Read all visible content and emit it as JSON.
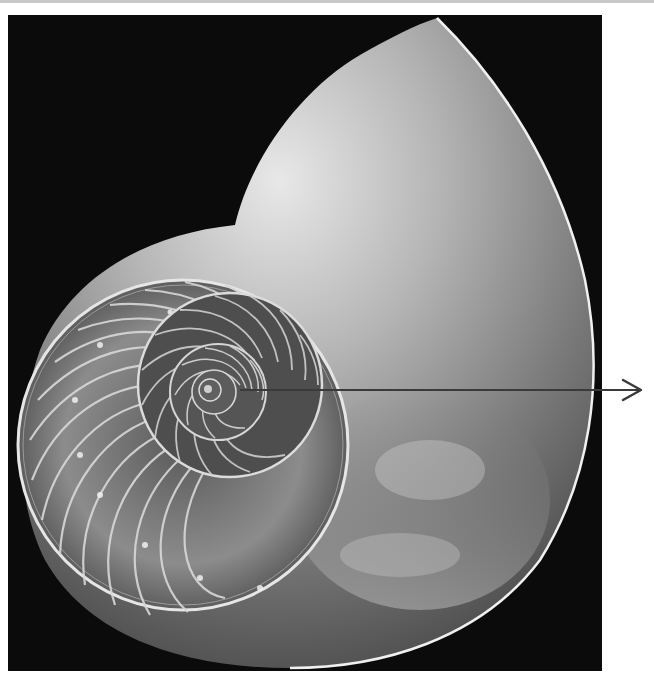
{
  "figure": {
    "background_color": "#0b0b0b",
    "page_background": "#ffffff",
    "shell_highlight": "#e6e6e6",
    "shell_midtone": "#8a8a8a",
    "shell_shadow": "#3a3a3a",
    "arrow": {
      "icon": "arrow-right-icon",
      "color": "#3a3a3a",
      "start": [
        240,
        390
      ],
      "end": [
        640,
        390
      ]
    },
    "spiral_center": [
      210,
      385
    ]
  }
}
